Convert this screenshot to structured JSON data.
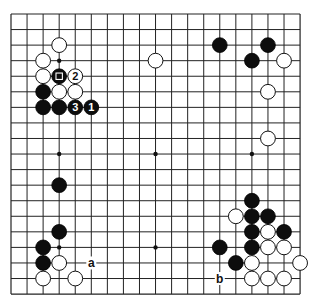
{
  "board": {
    "size": 19,
    "origin_x": 11,
    "origin_y": 14,
    "spacing_x": 16.06,
    "spacing_y": 15.56,
    "stone_radius": 7.4,
    "colors": {
      "black": "#0d0d0d",
      "white": "#ffffff",
      "line": "#222222"
    }
  },
  "star_points": [
    [
      3,
      3
    ],
    [
      9,
      3
    ],
    [
      15,
      3
    ],
    [
      3,
      9
    ],
    [
      9,
      9
    ],
    [
      15,
      9
    ],
    [
      3,
      15
    ],
    [
      9,
      15
    ],
    [
      15,
      15
    ]
  ],
  "stones": [
    {
      "color": "white",
      "col": 3,
      "row": 2
    },
    {
      "color": "white",
      "col": 2,
      "row": 3
    },
    {
      "color": "white",
      "col": 2,
      "row": 4
    },
    {
      "color": "black",
      "col": 3,
      "row": 4,
      "marker": "square"
    },
    {
      "color": "white",
      "col": 4,
      "row": 4,
      "label": "2"
    },
    {
      "color": "black",
      "col": 2,
      "row": 5
    },
    {
      "color": "white",
      "col": 3,
      "row": 5
    },
    {
      "color": "white",
      "col": 4,
      "row": 5
    },
    {
      "color": "black",
      "col": 2,
      "row": 6
    },
    {
      "color": "black",
      "col": 3,
      "row": 6
    },
    {
      "color": "black",
      "col": 4,
      "row": 6,
      "label": "3"
    },
    {
      "color": "black",
      "col": 5,
      "row": 6,
      "label": "1"
    },
    {
      "color": "white",
      "col": 9,
      "row": 3
    },
    {
      "color": "black",
      "col": 13,
      "row": 2
    },
    {
      "color": "black",
      "col": 16,
      "row": 2
    },
    {
      "color": "black",
      "col": 15,
      "row": 3
    },
    {
      "color": "white",
      "col": 17,
      "row": 3
    },
    {
      "color": "white",
      "col": 16,
      "row": 5
    },
    {
      "color": "white",
      "col": 16,
      "row": 8
    },
    {
      "color": "black",
      "col": 3,
      "row": 11
    },
    {
      "color": "black",
      "col": 3,
      "row": 14
    },
    {
      "color": "black",
      "col": 2,
      "row": 15
    },
    {
      "color": "black",
      "col": 2,
      "row": 16
    },
    {
      "color": "white",
      "col": 3,
      "row": 16
    },
    {
      "color": "white",
      "col": 2,
      "row": 17
    },
    {
      "color": "white",
      "col": 4,
      "row": 17
    },
    {
      "color": "black",
      "col": 15,
      "row": 12
    },
    {
      "color": "white",
      "col": 14,
      "row": 13
    },
    {
      "color": "black",
      "col": 15,
      "row": 13
    },
    {
      "color": "black",
      "col": 16,
      "row": 13
    },
    {
      "color": "black",
      "col": 15,
      "row": 14
    },
    {
      "color": "white",
      "col": 16,
      "row": 14
    },
    {
      "color": "black",
      "col": 17,
      "row": 14
    },
    {
      "color": "black",
      "col": 13,
      "row": 15
    },
    {
      "color": "black",
      "col": 15,
      "row": 15
    },
    {
      "color": "white",
      "col": 16,
      "row": 15
    },
    {
      "color": "white",
      "col": 17,
      "row": 15
    },
    {
      "color": "black",
      "col": 14,
      "row": 16
    },
    {
      "color": "white",
      "col": 15,
      "row": 16
    },
    {
      "color": "white",
      "col": 18,
      "row": 16
    },
    {
      "color": "white",
      "col": 15,
      "row": 17
    },
    {
      "color": "white",
      "col": 16,
      "row": 17
    },
    {
      "color": "white",
      "col": 17,
      "row": 17
    }
  ],
  "point_labels": [
    {
      "text": "a",
      "col": 5,
      "row": 16
    },
    {
      "text": "b",
      "col": 13,
      "row": 17
    }
  ]
}
